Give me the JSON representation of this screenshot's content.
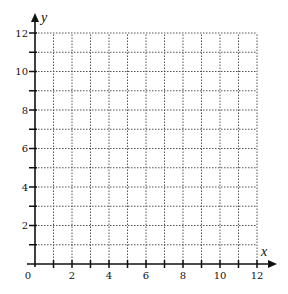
{
  "chart_data": {
    "type": "scatter",
    "title": "",
    "xlabel": "x",
    "ylabel": "y",
    "xlim": [
      0,
      12
    ],
    "ylim": [
      0,
      12
    ],
    "x_ticks": [
      0,
      1,
      2,
      3,
      4,
      5,
      6,
      7,
      8,
      9,
      10,
      11,
      12
    ],
    "y_ticks": [
      0,
      1,
      2,
      3,
      4,
      5,
      6,
      7,
      8,
      9,
      10,
      11,
      12
    ],
    "x_tick_labels": [
      "0",
      "2",
      "4",
      "6",
      "8",
      "10",
      "12"
    ],
    "y_tick_labels": [
      "2",
      "4",
      "6",
      "8",
      "10",
      "12"
    ],
    "grid": true,
    "grid_style": "dotted",
    "grid_step": 1,
    "series": [],
    "legend": null
  },
  "layout": {
    "origin_px": [
      35,
      264
    ],
    "x_end_px": 257,
    "y_end_px": 33,
    "axis_color": "#111111",
    "grid_color": "#555555"
  }
}
